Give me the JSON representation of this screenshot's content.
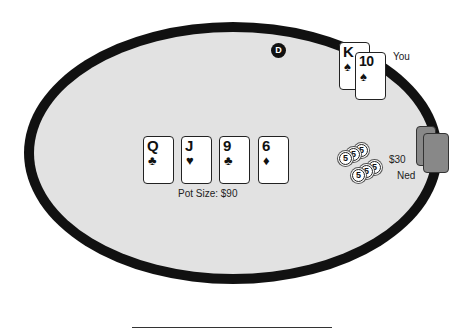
{
  "table": {
    "felt_color": "#e2e2e2",
    "rail_color": "#111111",
    "dealer_button": "D"
  },
  "community_cards": [
    {
      "rank": "Q",
      "suit": "♣",
      "suit_name": "clubs"
    },
    {
      "rank": "J",
      "suit": "♥",
      "suit_name": "hearts"
    },
    {
      "rank": "9",
      "suit": "♣",
      "suit_name": "clubs"
    },
    {
      "rank": "6",
      "suit": "♦",
      "suit_name": "diamonds"
    }
  ],
  "pot": {
    "label": "Pot Size: $90"
  },
  "players": {
    "you": {
      "name": "You",
      "hole_cards": [
        {
          "rank": "K",
          "suit": "♠",
          "suit_name": "spades"
        },
        {
          "rank": "10",
          "suit": "♠",
          "suit_name": "spades"
        }
      ]
    },
    "ned": {
      "name": "Ned",
      "bet": "$30",
      "chip_value": "5",
      "chip_count": 6
    }
  }
}
